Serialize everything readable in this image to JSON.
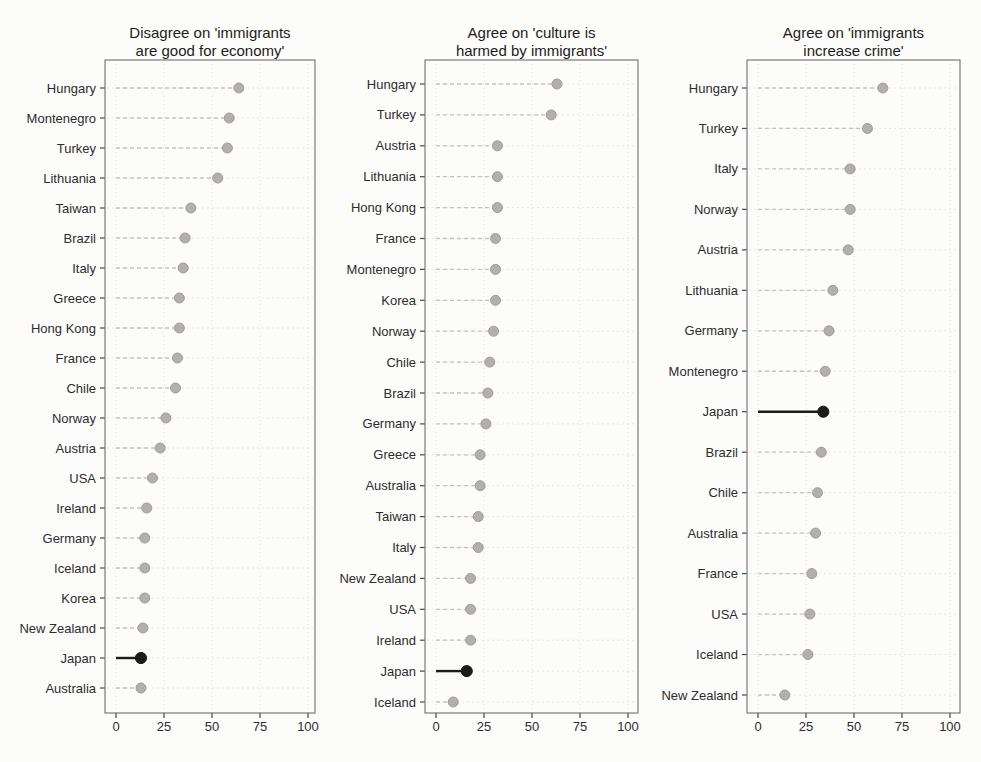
{
  "figure": {
    "x_axis": {
      "ticks": [
        0,
        25,
        50,
        75,
        100
      ],
      "lim": [
        0,
        100
      ]
    },
    "highlight_country": "Japan"
  },
  "colors": {
    "background": "#fcfcfb",
    "plot_bg": "#fcfcfb",
    "dot_fill": "#b3b0ac",
    "dot_stroke": "#a09d99",
    "stem": "#c7c4c0",
    "row_grid": "#ebe8e4",
    "col_grid": "#e7e5e1",
    "highlight": "#1b1b1b",
    "border": "#7d7b78",
    "axis_tick": "#4a4a4a",
    "text": "#2a2a2a"
  },
  "chart_data": [
    {
      "type": "lollipop",
      "title": "Disagree on 'immigrants are good for economy'",
      "title_lines": [
        "Disagree on 'immigrants",
        "are good for economy'"
      ],
      "xlabel": "",
      "ylabel": "",
      "xlim": [
        0,
        100
      ],
      "xticks": [
        0,
        25,
        50,
        75,
        100
      ],
      "grid": true,
      "highlight": "Japan",
      "categories": [
        "Hungary",
        "Montenegro",
        "Turkey",
        "Lithuania",
        "Taiwan",
        "Brazil",
        "Italy",
        "Greece",
        "Hong Kong",
        "France",
        "Chile",
        "Norway",
        "Austria",
        "USA",
        "Ireland",
        "Germany",
        "Iceland",
        "Korea",
        "New Zealand",
        "Japan",
        "Australia"
      ],
      "values": [
        64,
        59,
        58,
        53,
        39,
        36,
        35,
        33,
        33,
        32,
        31,
        26,
        23,
        19,
        16,
        15,
        15,
        15,
        14,
        13,
        13
      ]
    },
    {
      "type": "lollipop",
      "title": "Agree on 'culture is harmed by immigrants'",
      "title_lines": [
        "Agree on 'culture is",
        "harmed by immigrants'"
      ],
      "xlabel": "",
      "ylabel": "",
      "xlim": [
        0,
        100
      ],
      "xticks": [
        0,
        25,
        50,
        75,
        100
      ],
      "grid": true,
      "highlight": "Japan",
      "categories": [
        "Hungary",
        "Turkey",
        "Austria",
        "Lithuania",
        "Hong Kong",
        "France",
        "Montenegro",
        "Korea",
        "Norway",
        "Chile",
        "Brazil",
        "Germany",
        "Greece",
        "Australia",
        "Taiwan",
        "Italy",
        "New Zealand",
        "USA",
        "Ireland",
        "Japan",
        "Iceland"
      ],
      "values": [
        63,
        60,
        32,
        32,
        32,
        31,
        31,
        31,
        30,
        28,
        27,
        26,
        23,
        23,
        22,
        22,
        18,
        18,
        18,
        16,
        9
      ]
    },
    {
      "type": "lollipop",
      "title": "Agree on 'immigrants increase crime'",
      "title_lines": [
        "Agree on 'immigrants",
        "increase crime'"
      ],
      "xlabel": "",
      "ylabel": "",
      "xlim": [
        0,
        100
      ],
      "xticks": [
        0,
        25,
        50,
        75,
        100
      ],
      "grid": true,
      "highlight": "Japan",
      "categories": [
        "Hungary",
        "Turkey",
        "Italy",
        "Norway",
        "Austria",
        "Lithuania",
        "Germany",
        "Montenegro",
        "Japan",
        "Brazil",
        "Chile",
        "Australia",
        "France",
        "USA",
        "Iceland",
        "New Zealand"
      ],
      "values": [
        65,
        57,
        48,
        48,
        47,
        39,
        37,
        35,
        34,
        33,
        31,
        30,
        28,
        27,
        26,
        14
      ]
    }
  ]
}
